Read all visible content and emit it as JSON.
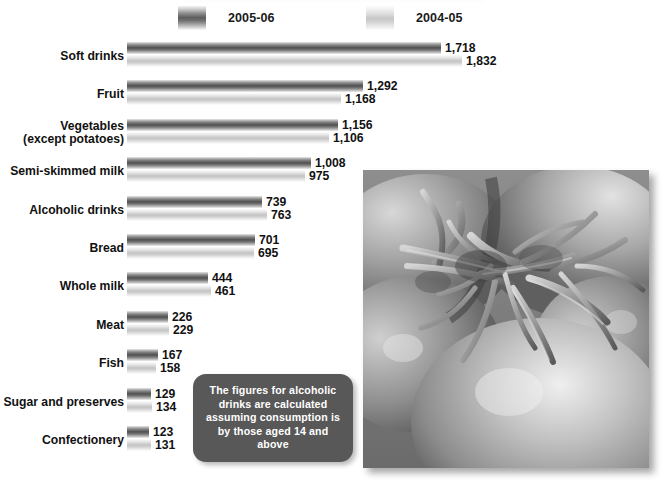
{
  "legend": {
    "items": [
      {
        "label": "2005-06",
        "key": "series_2005_06",
        "swatch": "dark-gradient-swatch"
      },
      {
        "label": "2004-05",
        "key": "series_2004_05",
        "swatch": "light-gradient-swatch"
      }
    ]
  },
  "callout": {
    "text": "The figures for alcoholic drinks are calculated assuming consumption is by those aged 14 and above"
  },
  "photo": {
    "alt": "Grayscale close-up photograph of ripe tomatoes with stems and calyx"
  },
  "chart_data": {
    "type": "bar",
    "orientation": "horizontal",
    "title": "",
    "xlabel": "",
    "ylabel": "",
    "grid": false,
    "legend_position": "top",
    "xlim": [
      0,
      1832
    ],
    "categories": [
      "Soft drinks",
      "Fruit",
      "Vegetables (except potatoes)",
      "Semi-skimmed milk",
      "Alcoholic drinks",
      "Bread",
      "Whole milk",
      "Meat",
      "Fish",
      "Sugar and preserves",
      "Confectionery"
    ],
    "category_lines": [
      [
        "Soft drinks"
      ],
      [
        "Fruit"
      ],
      [
        "Vegetables",
        "(except potatoes)"
      ],
      [
        "Semi-skimmed milk"
      ],
      [
        "Alcoholic drinks"
      ],
      [
        "Bread"
      ],
      [
        "Whole milk"
      ],
      [
        "Meat"
      ],
      [
        "Fish"
      ],
      [
        "Sugar and preserves"
      ],
      [
        "Confectionery"
      ]
    ],
    "series": [
      {
        "name": "2005-06",
        "color": "#5e5e5e",
        "values": [
          1718,
          1292,
          1156,
          1008,
          739,
          701,
          444,
          226,
          167,
          129,
          123
        ],
        "labels": [
          "1,718",
          "1,292",
          "1,156",
          "1,008",
          "739",
          "701",
          "444",
          "226",
          "167",
          "129",
          "123"
        ]
      },
      {
        "name": "2004-05",
        "color": "#c9c9c9",
        "values": [
          1832,
          1168,
          1106,
          975,
          763,
          695,
          461,
          229,
          158,
          134,
          131
        ],
        "labels": [
          "1,832",
          "1,168",
          "1,106",
          "975",
          "763",
          "695",
          "461",
          "229",
          "158",
          "134",
          "131"
        ]
      }
    ]
  }
}
